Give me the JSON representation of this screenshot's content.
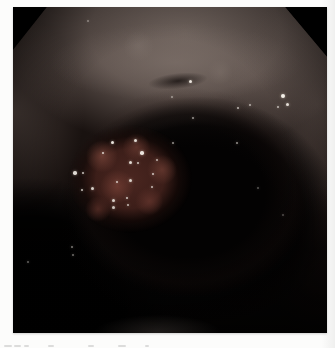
{
  "canvas": {
    "width": 335,
    "height": 348,
    "background": "#fcfcfb"
  },
  "figure": {
    "photo": {
      "alt": "endoscopic view of bowel lumen with nodular mass",
      "colors": {
        "mask_black": "#000000",
        "lumen_black": "#030202",
        "mucosa_light": "#6f635d",
        "mucosa_band": "#847770",
        "mucosa_mid": "#5c504b",
        "mass_red": "#4a2620",
        "mass_nodule": "#6e3e34",
        "specular_highlight": "#f4efe8"
      },
      "specular_dots": [
        [
          99,
          135,
          3,
          0.95
        ],
        [
          122,
          133,
          3,
          0.9
        ],
        [
          90,
          146,
          2.5,
          0.85
        ],
        [
          129,
          146,
          3.5,
          0.95
        ],
        [
          117,
          155,
          3,
          0.9
        ],
        [
          62,
          166,
          3.5,
          0.9
        ],
        [
          70,
          166,
          2.5,
          0.8
        ],
        [
          104,
          175,
          2.5,
          0.8
        ],
        [
          117,
          173,
          3,
          0.85
        ],
        [
          140,
          167,
          2.5,
          0.8
        ],
        [
          79,
          181,
          3,
          0.85
        ],
        [
          69,
          183,
          2.5,
          0.8
        ],
        [
          100,
          193,
          3,
          0.85
        ],
        [
          114,
          191,
          2.5,
          0.8
        ],
        [
          139,
          180,
          2.5,
          0.75
        ],
        [
          100,
          200,
          3,
          0.8
        ],
        [
          115,
          198,
          2.5,
          0.75
        ],
        [
          125,
          156,
          2.5,
          0.8
        ],
        [
          144,
          153,
          2,
          0.7
        ],
        [
          160,
          136,
          2,
          0.6
        ],
        [
          177,
          74,
          3,
          0.95
        ],
        [
          270,
          89,
          4,
          1
        ],
        [
          274,
          97,
          3,
          0.9
        ],
        [
          265,
          100,
          2,
          0.7
        ],
        [
          225,
          101,
          2,
          0.7
        ],
        [
          237,
          98,
          2,
          0.65
        ],
        [
          180,
          111,
          2,
          0.6
        ],
        [
          224,
          136,
          2,
          0.6
        ],
        [
          75,
          14,
          2,
          0.4
        ],
        [
          159,
          90,
          2,
          0.5
        ],
        [
          59,
          240,
          2,
          0.5
        ],
        [
          60,
          248,
          2,
          0.45
        ],
        [
          15,
          255,
          2,
          0.4
        ],
        [
          245,
          181,
          2,
          0.35
        ],
        [
          270,
          208,
          2,
          0.3
        ]
      ]
    },
    "caption": {
      "note": "cut-off caption line, only letter tops visible",
      "mark_color": "#c6c6c6",
      "marks": [
        [
          4,
          8
        ],
        [
          14,
          7
        ],
        [
          24,
          5
        ],
        [
          48,
          6
        ],
        [
          88,
          6
        ],
        [
          118,
          8
        ],
        [
          145,
          4
        ]
      ]
    }
  }
}
